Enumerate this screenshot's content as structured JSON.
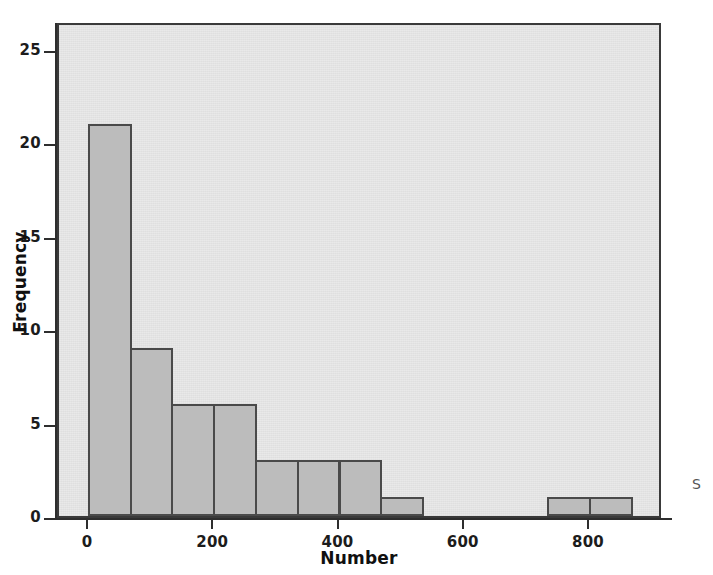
{
  "chart_data": {
    "type": "bar",
    "title": "",
    "subtitle": "",
    "xlabel": "Number",
    "ylabel": "Frequency",
    "xlim": [
      -66.7,
      893.3
    ],
    "ylim": [
      0,
      26.5
    ],
    "grid": false,
    "legend": null,
    "bin_width": 66.7,
    "x_ticks": [
      0,
      200,
      400,
      600,
      800
    ],
    "x_tick_labels": [
      "0",
      "200",
      "400",
      "600",
      "800"
    ],
    "y_ticks": [
      0,
      5,
      10,
      15,
      20,
      25
    ],
    "y_tick_labels": [
      "0",
      "5",
      "10",
      "15",
      "20",
      "25"
    ],
    "bins": [
      {
        "label": "0-67",
        "x_start": 0.0,
        "x_end": 66.7,
        "value": 21
      },
      {
        "label": "67-133",
        "x_start": 66.7,
        "x_end": 133.3,
        "value": 9
      },
      {
        "label": "133-200",
        "x_start": 133.3,
        "x_end": 200.0,
        "value": 6
      },
      {
        "label": "200-267",
        "x_start": 200.0,
        "x_end": 266.7,
        "value": 6
      },
      {
        "label": "267-333",
        "x_start": 266.7,
        "x_end": 333.3,
        "value": 3
      },
      {
        "label": "333-400",
        "x_start": 333.3,
        "x_end": 400.0,
        "value": 3
      },
      {
        "label": "400-467",
        "x_start": 400.0,
        "x_end": 466.7,
        "value": 3
      },
      {
        "label": "467-533",
        "x_start": 466.7,
        "x_end": 533.3,
        "value": 1
      },
      {
        "label": "533-600",
        "x_start": 533.3,
        "x_end": 600.0,
        "value": 0
      },
      {
        "label": "600-667",
        "x_start": 600.0,
        "x_end": 666.7,
        "value": 0
      },
      {
        "label": "667-733",
        "x_start": 666.7,
        "x_end": 733.3,
        "value": 0
      },
      {
        "label": "733-800",
        "x_start": 733.3,
        "x_end": 800.0,
        "value": 1
      },
      {
        "label": "800-867",
        "x_start": 800.0,
        "x_end": 866.7,
        "value": 1
      }
    ],
    "categories": [
      "0-67",
      "67-133",
      "133-200",
      "200-267",
      "267-333",
      "333-400",
      "400-467",
      "467-533",
      "533-600",
      "600-667",
      "667-733",
      "733-800",
      "800-867"
    ],
    "values": [
      21,
      9,
      6,
      6,
      3,
      3,
      3,
      1,
      0,
      0,
      0,
      1,
      1
    ],
    "annotations": [
      "S"
    ]
  },
  "colors": {
    "bar_fill": "#bcbcbc",
    "bar_stroke": "#4a4a4a",
    "plot_background": "#e9e9e9",
    "plot_border": "#3a3a3a",
    "axis": "#2e2e2e",
    "text": "#1c1c1c",
    "page_background": "#ffffff"
  }
}
